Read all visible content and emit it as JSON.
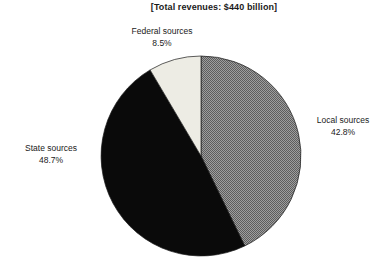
{
  "title": "[Total revenues: $440 billion]",
  "background_color": "#ffffff",
  "text_color": "#1a1a1a",
  "chart_data": {
    "type": "pie",
    "title": "[Total revenues: $440 billion]",
    "total_revenues": "$440 billion",
    "start_angle": "12-oclock",
    "direction": "clockwise",
    "legend_position": "none",
    "labels_outside": true,
    "stroke_color": "#1a1a1a",
    "pattern": {
      "name": "halftone-gray",
      "light": "#9e9e9e",
      "dark": "#5d5d5d"
    },
    "slices": [
      {
        "label": "Local sources",
        "value_pct": 42.8,
        "pct_label": "42.8%",
        "fill": "halftone",
        "base_color": "#8a8a8a"
      },
      {
        "label": "State sources",
        "value_pct": 48.7,
        "pct_label": "48.7%",
        "fill": "solid",
        "base_color": "#0a0a0a"
      },
      {
        "label": "Federal sources",
        "value_pct": 8.5,
        "pct_label": "8.5%",
        "fill": "solid",
        "base_color": "#edece4"
      }
    ]
  }
}
